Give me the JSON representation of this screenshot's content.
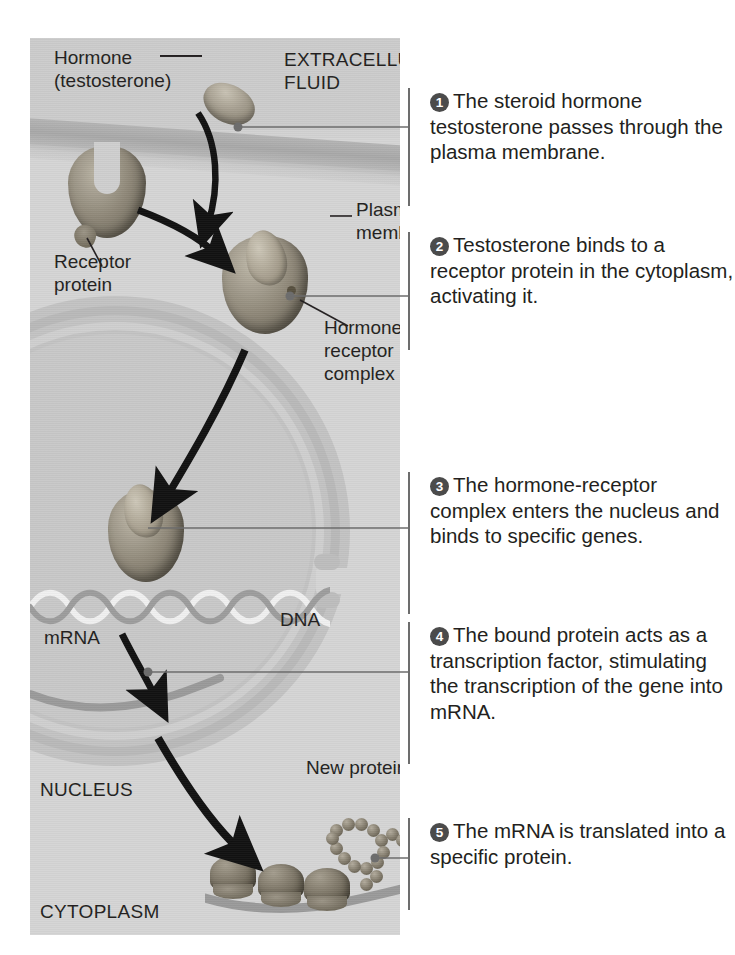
{
  "diagram": {
    "compartments": {
      "extracellular": "EXTRACELLULAR\nFLUID",
      "nucleus": "NUCLEUS",
      "cytoplasm": "CYTOPLASM"
    },
    "labels": {
      "hormone": "Hormone\n(testosterone)",
      "receptor_protein": "Receptor\nprotein",
      "plasma_membrane": "Plasma\nmembrane",
      "hormone_receptor_complex": "Hormone-\nreceptor\ncomplex",
      "dna": "DNA",
      "mrna": "mRNA",
      "new_protein": "New protein"
    },
    "colors": {
      "panel_background": "#d2d2d2",
      "extracellular_band": "#cccccc",
      "cytoplasm": "#d5d5d5",
      "nucleus": "#c3c3c3",
      "membrane": "#b4b4b4",
      "molecule_dark": "#5d5749",
      "molecule_light": "#bdb7a8",
      "text": "#231f20",
      "badge_fill": "#4b4b4b",
      "leader_line": "#6d6d6d"
    }
  },
  "steps": [
    {
      "number": "1",
      "text": "The steroid hormone testosterone passes through the plasma membrane."
    },
    {
      "number": "2",
      "text": "Testosterone binds to a receptor protein in the cytoplasm, activating it."
    },
    {
      "number": "3",
      "text": "The hormone-receptor complex enters the nucleus and binds to specific genes."
    },
    {
      "number": "4",
      "text": "The bound protein acts as a transcription factor, stimulating the transcription of the gene into mRNA."
    },
    {
      "number": "5",
      "text": "The mRNA is translated into a specific protein."
    }
  ]
}
